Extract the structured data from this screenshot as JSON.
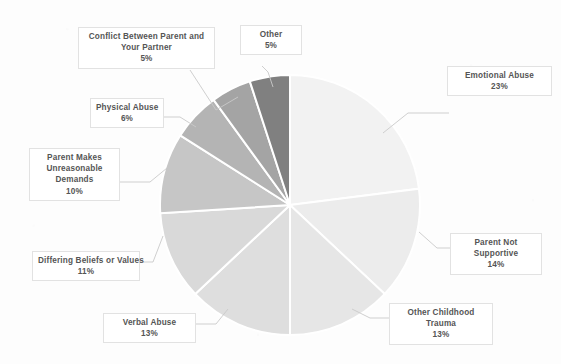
{
  "chart_data": {
    "type": "pie",
    "title": "",
    "legend_position": "callout-labels",
    "grid": false,
    "start_angle_deg": 0,
    "direction": "clockwise",
    "categories": [
      "Emotional Abuse",
      "Parent Not Supportive",
      "Other Childhood Trauma",
      "Verbal Abuse",
      "Differing Beliefs or Values",
      "Parent Makes Unreasonable Demands",
      "Physical Abuse",
      "Conflict Between Parent and Your Partner",
      "Other"
    ],
    "values": [
      23,
      14,
      13,
      13,
      11,
      10,
      6,
      5,
      5
    ],
    "unit": "%",
    "total": 100,
    "colors": [
      "#f2f2f2",
      "#ececec",
      "#e6e6e6",
      "#dedede",
      "#d9d9d9",
      "#c6c6c6",
      "#b4b4b4",
      "#a4a4a4",
      "#808080"
    ],
    "slice_border_color": "#ffffff"
  },
  "labels": {
    "emotional_abuse": {
      "name": "Emotional Abuse",
      "pct": "23%"
    },
    "parent_not_supportive": {
      "name1": "Parent Not",
      "name2": "Supportive",
      "pct": "14%"
    },
    "other_childhood_trauma": {
      "name1": "Other Childhood",
      "name2": "Trauma",
      "pct": "13%"
    },
    "verbal_abuse": {
      "name": "Verbal Abuse",
      "pct": "13%"
    },
    "differing_beliefs": {
      "name": "Differing Beliefs or Values",
      "pct": "11%"
    },
    "parent_demands": {
      "name1": "Parent Makes",
      "name2": "Unreasonable",
      "name3": "Demands",
      "pct": "10%"
    },
    "physical_abuse": {
      "name": "Physical Abuse",
      "pct": "6%"
    },
    "conflict_partner": {
      "name1": "Conflict Between Parent and",
      "name2": "Your Partner",
      "pct": "5%"
    },
    "other": {
      "name": "Other",
      "pct": "5%"
    }
  }
}
